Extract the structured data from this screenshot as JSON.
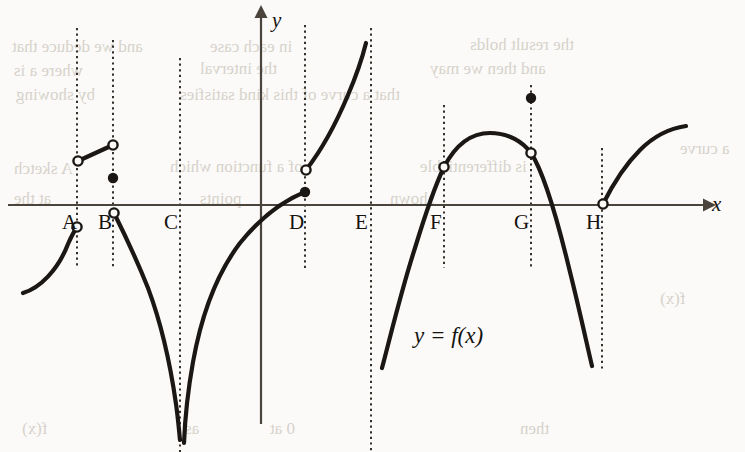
{
  "figure": {
    "caption_label": "y = f(x)",
    "axes": {
      "x_axis_label": "x",
      "y_axis_label": "y",
      "x_axis_y_pixel": 205,
      "y_axis_x_pixel": 261
    },
    "tick_labels": [
      {
        "name": "A",
        "text": "A",
        "x": 62,
        "y": 212,
        "line_x": 77
      },
      {
        "name": "B",
        "text": "B",
        "x": 98,
        "y": 212,
        "line_x": 113
      },
      {
        "name": "C",
        "text": "C",
        "x": 164,
        "y": 212,
        "line_x": 180
      },
      {
        "name": "D",
        "text": "D",
        "x": 289,
        "y": 212,
        "line_x": 305
      },
      {
        "name": "E",
        "text": "E",
        "x": 355,
        "y": 212,
        "line_x": 371
      },
      {
        "name": "F",
        "text": "F",
        "x": 430,
        "y": 212,
        "line_x": 444
      },
      {
        "name": "G",
        "text": "G",
        "x": 514,
        "y": 212,
        "line_x": 531
      },
      {
        "name": "H",
        "text": "H",
        "x": 586,
        "y": 212,
        "line_x": 602
      }
    ],
    "colors": {
      "curve": "#1a1714",
      "axis": "#4a443c",
      "dashed_guide": "#2b2722",
      "background": "#fbfaf8",
      "text": "#16130f"
    },
    "bleed_text": [
      {
        "text": "and we deduce that",
        "x": 12,
        "y": 38
      },
      {
        "text": "in each case",
        "x": 210,
        "y": 38
      },
      {
        "text": "the result holds",
        "x": 470,
        "y": 36
      },
      {
        "text": "where a is",
        "x": 14,
        "y": 62
      },
      {
        "text": "the interval",
        "x": 200,
        "y": 60
      },
      {
        "text": "and then we may",
        "x": 430,
        "y": 60
      },
      {
        "text": "by showing",
        "x": 16,
        "y": 86
      },
      {
        "text": "that a curve of this kind satisfies",
        "x": 180,
        "y": 86
      },
      {
        "text": "A sketch",
        "x": 14,
        "y": 160
      },
      {
        "text": "of a function which",
        "x": 170,
        "y": 158
      },
      {
        "text": "is differentiable",
        "x": 420,
        "y": 158
      },
      {
        "text": "at the",
        "x": 14,
        "y": 190
      },
      {
        "text": "points",
        "x": 200,
        "y": 190
      },
      {
        "text": "shown",
        "x": 390,
        "y": 190
      },
      {
        "text": "f(x)",
        "x": 660,
        "y": 290
      },
      {
        "text": "a curve",
        "x": 680,
        "y": 140
      },
      {
        "text": "f(x)",
        "x": 22,
        "y": 420
      },
      {
        "text": "as",
        "x": 185,
        "y": 420
      },
      {
        "text": "0 at",
        "x": 270,
        "y": 420
      },
      {
        "text": "then",
        "x": 520,
        "y": 420
      }
    ]
  },
  "chart_data": {
    "type": "line",
    "title": "",
    "subtitle": "",
    "xlabel": "x",
    "ylabel": "y",
    "grid": false,
    "legend": "none",
    "annotation": "y = f(x)",
    "marked_x_values": [
      "A",
      "B",
      "C",
      "D",
      "E",
      "F",
      "G",
      "H"
    ],
    "feature_at_points": [
      {
        "point": "A",
        "feature": "jump discontinuity (both one-sided limits exist, open circles above and below the axis)"
      },
      {
        "point": "B",
        "feature": "removable/jump discontinuity with an isolated defined value (filled dot) above the axis"
      },
      {
        "point": "C",
        "feature": "vertical asymptote, f tends to minus infinity on both sides"
      },
      {
        "point": "D",
        "feature": "jump discontinuity, filled dot below the open circle"
      },
      {
        "point": "E",
        "feature": "vertical asymptote / endpoint of branch, function undefined on interval to the right"
      },
      {
        "point": "F",
        "feature": "corner: curve continues through with a change in slope"
      },
      {
        "point": "G",
        "feature": "removable discontinuity: open circle on curve, filled dot above"
      },
      {
        "point": "H",
        "feature": "cusp / vertical tangent at the x-axis with open circle"
      }
    ],
    "segments": [
      {
        "name": "branch-left-of-A",
        "path": "M 23,293 C 40,288 58,270 68,244 C 72,235 75,230 77,227",
        "endpoints": [
          {
            "x": 23,
            "y": 293,
            "marker": "none"
          },
          {
            "x": 77,
            "y": 227,
            "marker": "open"
          }
        ]
      },
      {
        "name": "segment-A-to-B-above-axis",
        "path": "M 78,161 L 113,145",
        "endpoints": [
          {
            "x": 78,
            "y": 161,
            "marker": "open"
          },
          {
            "x": 113,
            "y": 145,
            "marker": "open"
          }
        ]
      },
      {
        "name": "isolated-point-B",
        "path": "",
        "endpoints": [
          {
            "x": 113,
            "y": 178,
            "marker": "filled"
          }
        ]
      },
      {
        "name": "branch-B-to-C-asymptote",
        "path": "M 114,213 C 124,233 136,258 148,288 C 160,320 170,362 176,404 C 178,418 179,430 180,440",
        "endpoints": [
          {
            "x": 114,
            "y": 213,
            "marker": "open"
          },
          {
            "x": 180,
            "y": 440,
            "marker": "none"
          }
        ]
      },
      {
        "name": "branch-C-asymptote-to-D",
        "path": "M 184,443 C 185,418 188,390 193,362 C 202,312 218,272 240,243 C 262,216 285,200 305,192",
        "endpoints": [
          {
            "x": 184,
            "y": 443,
            "marker": "none"
          },
          {
            "x": 305,
            "y": 192,
            "marker": "filled"
          }
        ]
      },
      {
        "name": "branch-D-to-E",
        "path": "M 306,170 C 320,152 335,126 348,95 C 357,74 363,55 366,43",
        "endpoints": [
          {
            "x": 306,
            "y": 170,
            "marker": "open"
          },
          {
            "x": 366,
            "y": 43,
            "marker": "none"
          }
        ]
      },
      {
        "name": "branch-E-to-F-to-G-to-H",
        "path": "M 382,368 C 392,330 402,288 415,248 C 426,212 434,188 444,167 C 456,144 472,133 490,133 C 509,133 523,142 531,153 C 545,174 558,222 570,272 C 580,312 587,345 592,366",
        "endpoints": [
          {
            "x": 382,
            "y": 368,
            "marker": "none"
          },
          {
            "x": 444,
            "y": 167,
            "marker": "open"
          },
          {
            "x": 531,
            "y": 153,
            "marker": "open"
          },
          {
            "x": 592,
            "y": 366,
            "marker": "none"
          }
        ]
      },
      {
        "name": "isolated-point-G",
        "path": "",
        "endpoints": [
          {
            "x": 531,
            "y": 98,
            "marker": "filled"
          }
        ]
      },
      {
        "name": "branch-right-of-H",
        "path": "M 603,204 C 612,186 624,166 640,150 C 656,134 672,128 686,126",
        "endpoints": [
          {
            "x": 603,
            "y": 204,
            "marker": "open"
          },
          {
            "x": 686,
            "y": 126,
            "marker": "none"
          }
        ]
      }
    ],
    "dashed_guides": [
      {
        "name": "A",
        "x": 77,
        "y1": 28,
        "y2": 268
      },
      {
        "name": "B",
        "x": 113,
        "y1": 40,
        "y2": 268
      },
      {
        "name": "C",
        "x": 180,
        "y1": 58,
        "y2": 452
      },
      {
        "name": "D",
        "x": 305,
        "y1": 25,
        "y2": 268
      },
      {
        "name": "E",
        "x": 371,
        "y1": 28,
        "y2": 452
      },
      {
        "name": "F",
        "x": 444,
        "y1": 105,
        "y2": 268
      },
      {
        "name": "G",
        "x": 531,
        "y1": 85,
        "y2": 268
      },
      {
        "name": "H",
        "x": 602,
        "y1": 148,
        "y2": 372
      }
    ]
  }
}
